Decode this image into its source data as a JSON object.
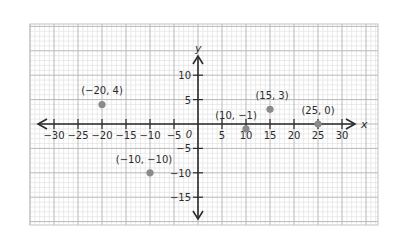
{
  "chart_data": {
    "type": "scatter",
    "title": "",
    "xlabel": "x",
    "ylabel": "y",
    "xlim": [
      -35,
      37
    ],
    "ylim": [
      -21,
      20
    ],
    "grid": true,
    "legend": null,
    "x_ticks": [
      -30,
      -25,
      -20,
      -15,
      -10,
      -5,
      5,
      10,
      15,
      20,
      25,
      30
    ],
    "x_tick_labels": [
      "-30",
      "-25",
      "-20",
      "-15",
      "-10",
      "-5",
      "5",
      "10",
      "15",
      "20",
      "25",
      "30"
    ],
    "y_ticks": [
      10,
      5,
      -5,
      -10,
      -15
    ],
    "y_tick_labels": [
      "10",
      "5",
      "-5",
      "-10",
      "-15"
    ],
    "origin_label": "0",
    "series": [
      {
        "name": "points",
        "color": "#8a8a8a",
        "points": [
          {
            "x": -20,
            "y": 4,
            "label": "(-20, 4)"
          },
          {
            "x": -10,
            "y": -10,
            "label": "(-10, -10)"
          },
          {
            "x": 10,
            "y": -1,
            "label": "(10, -1)"
          },
          {
            "x": 15,
            "y": 3,
            "label": "(15, 3)"
          },
          {
            "x": 25,
            "y": 0,
            "label": "(25, 0)"
          }
        ]
      }
    ]
  },
  "style": {
    "axis_color": "#2b2b2b",
    "major_grid_color": "#b8b8b8",
    "minor_grid_color": "#e2e2e2",
    "border_color": "#c4c4c4",
    "point_color": "#8a8a8a",
    "text_color": "#2b2b2b"
  }
}
